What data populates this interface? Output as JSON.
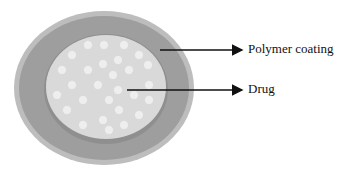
{
  "diagram": {
    "type": "drug-delivery-particle",
    "colors": {
      "outer_coating": "#9e9e9e",
      "outer_rim": "#b5b5b5",
      "core": "#d9d9d9",
      "drug_dot": "#ececec",
      "arrow": "#111111"
    },
    "labels": {
      "polymer": "Polymer coating",
      "drug": "Drug"
    }
  }
}
